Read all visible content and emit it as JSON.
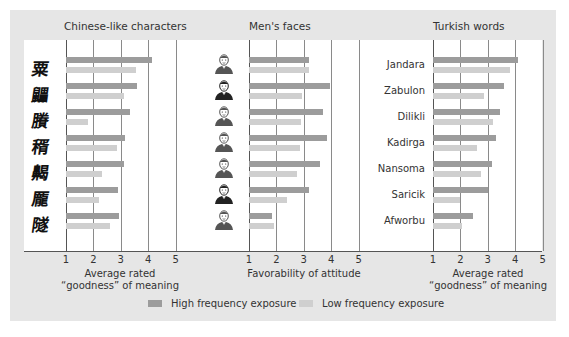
{
  "colors": {
    "high": "#9c9c9c",
    "low": "#cfcfcf",
    "panel_bg": "#e6e6e6",
    "plot_bg": "#ffffff"
  },
  "legend": {
    "high_label": "High frequency exposure",
    "low_label": "Low frequency exposure"
  },
  "panels": [
    {
      "title": "Chinese-like characters",
      "xlabel_line1": "Average rated",
      "xlabel_line2": "“goodness” of meaning"
    },
    {
      "title": "Men's faces",
      "xlabel_line1": "Favorability of attitude",
      "xlabel_line2": ""
    },
    {
      "title": "Turkish words",
      "xlabel_line1": "Average rated",
      "xlabel_line2": "“goodness” of meaning"
    }
  ],
  "ticks": [
    "1",
    "2",
    "3",
    "4",
    "5"
  ],
  "chart_data": [
    {
      "type": "bar",
      "orientation": "horizontal",
      "title": "Chinese-like characters",
      "xlabel": "Average rated “goodness” of meaning",
      "xlim": [
        1,
        5
      ],
      "categories": [
        "character-1",
        "character-2",
        "character-3",
        "character-4",
        "character-5",
        "character-6",
        "character-7"
      ],
      "series": [
        {
          "name": "High frequency exposure",
          "values": [
            4.15,
            3.6,
            3.35,
            3.15,
            3.1,
            2.9,
            2.95
          ]
        },
        {
          "name": "Low frequency exposure",
          "values": [
            3.55,
            3.1,
            1.8,
            2.85,
            2.3,
            2.2,
            2.6
          ]
        }
      ],
      "grid": true
    },
    {
      "type": "bar",
      "orientation": "horizontal",
      "title": "Men's faces",
      "xlabel": "Favorability of attitude",
      "xlim": [
        1,
        5
      ],
      "categories": [
        "face-1",
        "face-2",
        "face-3",
        "face-4",
        "face-5",
        "face-6",
        "face-7"
      ],
      "series": [
        {
          "name": "High frequency exposure",
          "values": [
            3.2,
            3.95,
            3.7,
            3.85,
            3.6,
            3.2,
            1.85
          ]
        },
        {
          "name": "Low frequency exposure",
          "values": [
            3.2,
            2.95,
            2.9,
            2.85,
            2.75,
            2.4,
            1.9
          ]
        }
      ],
      "grid": true
    },
    {
      "type": "bar",
      "orientation": "horizontal",
      "title": "Turkish words",
      "xlabel": "Average rated “goodness” of meaning",
      "xlim": [
        1,
        5
      ],
      "categories": [
        "Jandara",
        "Zabulon",
        "Dilikli",
        "Kadirga",
        "Nansoma",
        "Saricik",
        "Afworbu"
      ],
      "series": [
        {
          "name": "High frequency exposure",
          "values": [
            4.1,
            3.6,
            3.45,
            3.3,
            3.15,
            3.0,
            2.45
          ]
        },
        {
          "name": "Low frequency exposure",
          "values": [
            3.8,
            2.85,
            3.2,
            2.6,
            2.75,
            2.0,
            2.05
          ]
        }
      ],
      "grid": true,
      "legend_position": "bottom"
    }
  ]
}
